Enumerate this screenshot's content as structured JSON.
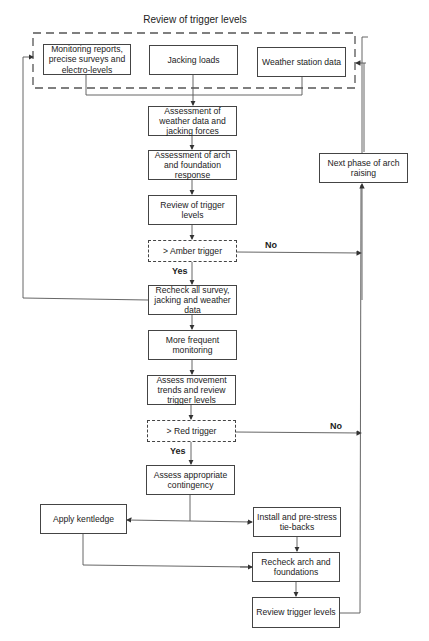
{
  "diagram": {
    "group_title": "Review of trigger levels",
    "inputs": [
      {
        "label": "Monitoring reports, precise surveys and electro-levels"
      },
      {
        "label": "Jacking loads"
      },
      {
        "label": "Weather station data"
      }
    ],
    "steps": {
      "assess_weather": "Assessment of weather data and jacking forces",
      "assess_arch": "Assessment of arch and foundation response",
      "review1": "Review of trigger levels",
      "amber": "> Amber trigger",
      "recheck_all": "Recheck all survey, jacking and weather data",
      "more_frequent": "More frequent monitoring",
      "assess_movement": "Assess movement trends and review trigger levels",
      "red": "> Red trigger",
      "assess_contingency": "Assess appropriate contingency",
      "apply_kentledge": "Apply kentledge",
      "install_tiebacks": "Install and pre-stress tie-backs",
      "recheck_arch": "Recheck arch and foundations",
      "review2": "Review trigger levels",
      "next_phase": "Next phase of arch raising"
    },
    "edge_labels": {
      "amber_no": "No",
      "amber_yes": "Yes",
      "red_no": "No",
      "red_yes": "Yes"
    }
  }
}
